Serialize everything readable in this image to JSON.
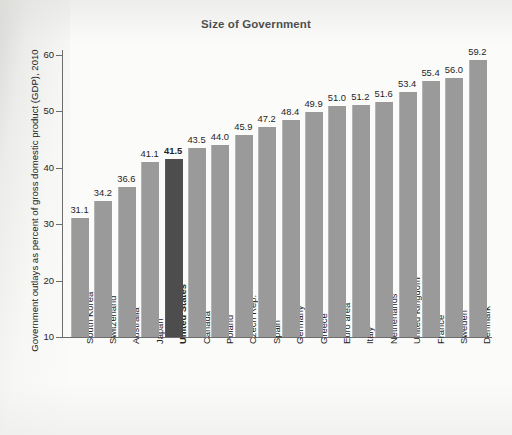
{
  "chart_data": {
    "type": "bar",
    "title": "Size of Government",
    "xlabel": "",
    "ylabel": "Government outlays as percent of gross domestic product (GDP), 2010",
    "ylim": [
      10,
      62
    ],
    "yticks": [
      10,
      20,
      30,
      40,
      50,
      60
    ],
    "ytick_labels": [
      "10",
      "20",
      "30",
      "40",
      "50",
      "60"
    ],
    "grid": false,
    "legend": "none",
    "highlight_category": "United States",
    "bar_color": "#9a9a9a",
    "highlight_color": "#4d4d4d",
    "categories": [
      "South Korea",
      "Switzerland",
      "Australia",
      "Japan",
      "United States",
      "Canada",
      "Poland",
      "Czech Rep.",
      "Spain",
      "Germany",
      "Greece",
      "Euro area",
      "Italy",
      "Netherlands",
      "United Kingdom",
      "France",
      "Sweden",
      "Denmark"
    ],
    "values": [
      31.1,
      34.2,
      36.6,
      41.1,
      41.5,
      43.5,
      44.0,
      45.9,
      47.2,
      48.4,
      49.9,
      51.0,
      51.2,
      51.6,
      53.4,
      55.4,
      56.0,
      59.2
    ],
    "value_labels": [
      "31.1",
      "34.2",
      "36.6",
      "41.1",
      "41.5",
      "43.5",
      "44.0",
      "45.9",
      "47.2",
      "48.4",
      "49.9",
      "51.0",
      "51.2",
      "51.6",
      "53.4",
      "55.4",
      "56.0",
      "59.2"
    ]
  }
}
